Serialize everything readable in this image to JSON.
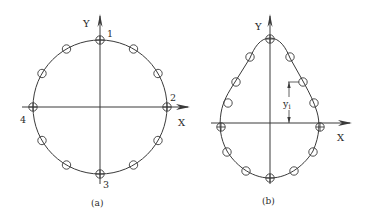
{
  "figures": [
    {
      "id": "a",
      "caption": "(a)",
      "shape": "circle",
      "axis_labels": {
        "x": "X",
        "y": "Y"
      },
      "point_labels": [
        "1",
        "2",
        "3",
        "4"
      ],
      "marker_count": 12
    },
    {
      "id": "b",
      "caption": "(b)",
      "shape": "teardrop",
      "axis_labels": {
        "x": "X",
        "y": "Y"
      },
      "dimension_label": "y",
      "dimension_subscript": "i",
      "marker_count": 14
    }
  ],
  "colors": {
    "stroke": "#3a3a3a",
    "background": "#ffffff"
  }
}
